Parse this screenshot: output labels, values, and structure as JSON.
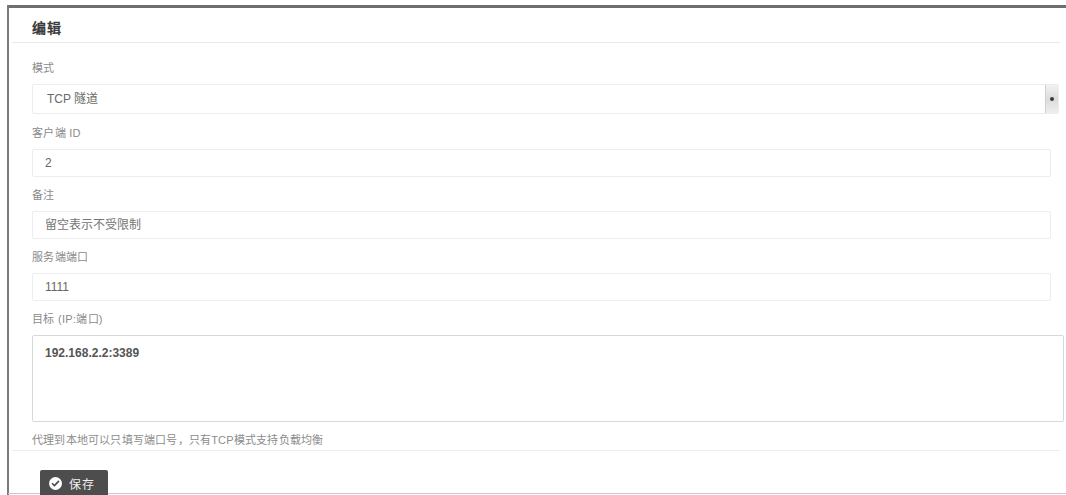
{
  "window": {
    "title": "编辑"
  },
  "form": {
    "mode": {
      "label": "模式",
      "value": "TCP 隧道",
      "options": [
        "TCP 隧道"
      ]
    },
    "client_id": {
      "label": "客户端 ID",
      "value": "2",
      "placeholder": ""
    },
    "note": {
      "label": "备注",
      "value": "",
      "placeholder": "留空表示不受限制"
    },
    "server_port": {
      "label": "服务端端口",
      "value": "1111",
      "placeholder": ""
    },
    "target": {
      "label": "目标 (IP:端口)",
      "value": "192.168.2.2:3389",
      "placeholder": "",
      "help": "代理到本地可以只填写端口号，只有TCP模式支持负载均衡"
    }
  },
  "footer": {
    "save_label": "保存",
    "save_icon": "check-circle-icon"
  },
  "icons": {
    "dropdown": "chevron-down-icon"
  },
  "colors": {
    "button_bg": "#4d4d4d",
    "button_text": "#f0f0f0",
    "label_text": "#8a8a8a",
    "value_text": "#666666",
    "border": "#ededed",
    "frame": "#6e6e6e"
  }
}
